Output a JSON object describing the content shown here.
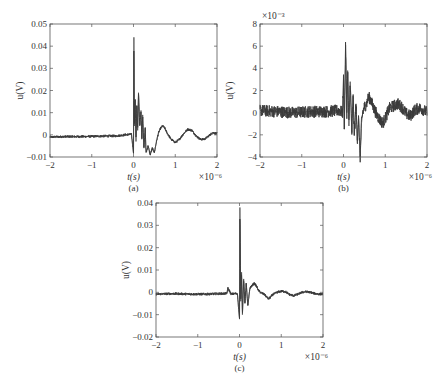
{
  "chart_data": [
    {
      "id": "a",
      "type": "line",
      "subplot_label": "(a)",
      "title": "",
      "xlabel": "t(s)",
      "ylabel": "u(V)",
      "x_multiplier": "×10⁻⁶",
      "y_multiplier": "",
      "xlim": [
        -2,
        2
      ],
      "ylim": [
        -0.01,
        0.05
      ],
      "xticks": [
        -2,
        -1,
        0,
        1,
        2
      ],
      "xtick_labels": [
        "−2",
        "−1",
        "0",
        "1",
        "2"
      ],
      "yticks": [
        -0.01,
        0,
        0.01,
        0.02,
        0.03,
        0.04,
        0.05
      ],
      "ytick_labels": [
        "−0.01",
        "0",
        "0.01",
        "0.02",
        "0.03",
        "0.04",
        "0.05"
      ],
      "grid": false,
      "box": {
        "left": 50,
        "top": 24,
        "right": 217,
        "bottom": 157
      },
      "series": [
        {
          "name": "u(t)",
          "color": "#3a3a3a",
          "x": [
            -2.0,
            -1.6,
            -1.2,
            -0.8,
            -0.4,
            -0.2,
            -0.05,
            0.0,
            0.01,
            0.02,
            0.04,
            0.06,
            0.08,
            0.1,
            0.12,
            0.15,
            0.18,
            0.2,
            0.22,
            0.25,
            0.28,
            0.3,
            0.35,
            0.4,
            0.45,
            0.5,
            0.55,
            0.6,
            0.65,
            0.7,
            0.75,
            0.8,
            0.9,
            1.0,
            1.1,
            1.2,
            1.3,
            1.4,
            1.5,
            1.6,
            1.7,
            1.8,
            1.9,
            2.0
          ],
          "y": [
            -0.001,
            -0.0008,
            -0.0008,
            -0.0006,
            -0.0005,
            0.0,
            0.0003,
            -0.008,
            0.044,
            0.004,
            0.016,
            -0.003,
            0.013,
            0.002,
            0.019,
            0.004,
            0.011,
            -0.002,
            0.009,
            -0.006,
            0.003,
            -0.008,
            -0.005,
            -0.009,
            -0.006,
            -0.008,
            -0.003,
            0.001,
            0.003,
            0.004,
            0.003,
            0.001,
            -0.002,
            -0.0035,
            -0.002,
            0.0005,
            0.0025,
            0.002,
            -0.0005,
            -0.002,
            -0.002,
            -0.0005,
            0.001,
            0.0005
          ],
          "noise_amplitude": 0.0006
        }
      ]
    },
    {
      "id": "b",
      "type": "line",
      "subplot_label": "(b)",
      "title": "",
      "xlabel": "t(s)",
      "ylabel": "u(V)",
      "x_multiplier": "×10⁻⁶",
      "y_multiplier": "×10⁻³",
      "xlim": [
        -2,
        2
      ],
      "ylim": [
        -4,
        8
      ],
      "xticks": [
        -2,
        -1,
        0,
        1,
        2
      ],
      "xtick_labels": [
        "−2",
        "−1",
        "0",
        "1",
        "2"
      ],
      "yticks": [
        -4,
        -2,
        0,
        2,
        4,
        6,
        8
      ],
      "ytick_labels": [
        "−4",
        "−2",
        "0",
        "2",
        "4",
        "6",
        "8"
      ],
      "grid": false,
      "box": {
        "left": 260,
        "top": 24,
        "right": 427,
        "bottom": 157
      },
      "series": [
        {
          "name": "u(t)",
          "color": "#3a3a3a",
          "x": [
            -2.0,
            -1.6,
            -1.2,
            -0.8,
            -0.4,
            -0.1,
            -0.02,
            0.0,
            0.02,
            0.05,
            0.08,
            0.1,
            0.13,
            0.16,
            0.2,
            0.23,
            0.26,
            0.3,
            0.33,
            0.36,
            0.4,
            0.43,
            0.46,
            0.5,
            0.55,
            0.6,
            0.65,
            0.7,
            0.8,
            0.9,
            0.95,
            1.0,
            1.1,
            1.2,
            1.3,
            1.4,
            1.5,
            1.6,
            1.7,
            1.8,
            1.9,
            2.0
          ],
          "y": [
            0.2,
            0.1,
            0.0,
            0.1,
            0.1,
            0.2,
            0.0,
            3.0,
            -1.5,
            6.1,
            0.0,
            3.8,
            -1.2,
            2.8,
            -1.8,
            1.5,
            -2.0,
            0.8,
            -2.5,
            -0.5,
            -4.0,
            -1.0,
            0.0,
            0.5,
            0.8,
            1.4,
            1.2,
            0.6,
            -0.2,
            -0.8,
            -0.9,
            -0.5,
            0.4,
            0.6,
            0.8,
            0.5,
            -0.1,
            -0.3,
            0.2,
            0.4,
            0.3,
            0.0
          ],
          "noise_amplitude": 0.55
        }
      ]
    },
    {
      "id": "c",
      "type": "line",
      "subplot_label": "(c)",
      "title": "",
      "xlabel": "t(s)",
      "ylabel": "u(V)",
      "x_multiplier": "×10⁻⁶",
      "y_multiplier": "",
      "xlim": [
        -2,
        2
      ],
      "ylim": [
        -0.02,
        0.04
      ],
      "xticks": [
        -2,
        -1,
        0,
        1,
        2
      ],
      "xtick_labels": [
        "−2",
        "−1",
        "0",
        "1",
        "2"
      ],
      "yticks": [
        -0.02,
        -0.01,
        0,
        0.01,
        0.02,
        0.03,
        0.04
      ],
      "ytick_labels": [
        "−0.02",
        "−0.01",
        "0",
        "0.01",
        "0.02",
        "0.03",
        "0.04"
      ],
      "grid": false,
      "box": {
        "left": 156,
        "top": 203,
        "right": 323,
        "bottom": 337
      },
      "series": [
        {
          "name": "u(t)",
          "color": "#3a3a3a",
          "x": [
            -2.0,
            -1.6,
            -1.2,
            -0.8,
            -0.4,
            -0.3,
            -0.28,
            -0.2,
            -0.05,
            0.0,
            0.01,
            0.03,
            0.05,
            0.07,
            0.1,
            0.13,
            0.16,
            0.2,
            0.25,
            0.3,
            0.35,
            0.4,
            0.45,
            0.5,
            0.6,
            0.7,
            0.8,
            0.9,
            1.0,
            1.1,
            1.2,
            1.3,
            1.4,
            1.5,
            1.6,
            1.7,
            1.8,
            1.9,
            2.0
          ],
          "y": [
            -0.0008,
            -0.0006,
            -0.0008,
            -0.0008,
            -0.0006,
            -0.0005,
            0.002,
            -0.0008,
            -0.0005,
            -0.012,
            0.038,
            -0.004,
            0.009,
            -0.01,
            0.006,
            -0.005,
            0.004,
            -0.006,
            0.002,
            0.003,
            0.004,
            0.003,
            0.001,
            0.0,
            -0.001,
            -0.003,
            -0.001,
            0.0,
            0.0005,
            0.0003,
            -0.001,
            -0.0015,
            -0.0008,
            0.0,
            0.0003,
            0.0,
            -0.0005,
            -0.0008,
            -0.0008
          ],
          "noise_amplitude": 0.0006
        }
      ]
    }
  ]
}
